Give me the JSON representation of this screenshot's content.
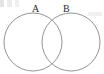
{
  "figure": {
    "kind": "venn-diagram",
    "title": "",
    "width": 104,
    "height": 74,
    "background_color": "#ffffff",
    "stroke_color": "#878787",
    "label_color": "#2b2b2b"
  },
  "labels": {
    "set_a": "A",
    "set_b": "B"
  },
  "circles": [
    {
      "name": "circle-a",
      "label": "A",
      "cx": 33,
      "cy": 42,
      "r": 29
    },
    {
      "name": "circle-b",
      "label": "B",
      "cx": 71,
      "cy": 42,
      "r": 29
    }
  ],
  "artifacts": {
    "top_left_scan_marks": "faint gray specks",
    "right_edge_scan_mark": "faint gray smudge"
  }
}
